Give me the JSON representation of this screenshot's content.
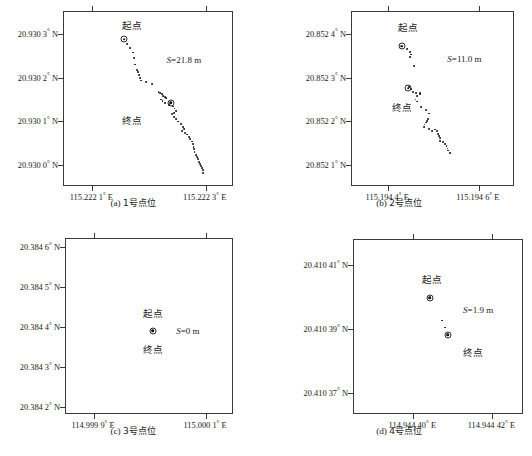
{
  "figure": {
    "panels": [
      {
        "id": "a",
        "caption_label": "(a)",
        "caption_text": "1号点位",
        "s_label": "S",
        "s_value": "=21.8 m",
        "s_full": "S=21.8 m",
        "start_label": "起点",
        "end_label": "终点",
        "y_ticks": [
          "20.930 3° N",
          "20.930 2° N",
          "20.930 1° N",
          "20.930 0° N"
        ],
        "x_ticks": [
          "115.222 1° E",
          "115.222 3° E"
        ]
      },
      {
        "id": "b",
        "caption_label": "(b)",
        "caption_text": "2号点位",
        "s_label": "S",
        "s_value": "=11.0 m",
        "s_full": "S=11.0 m",
        "start_label": "起点",
        "end_label": "终点",
        "y_ticks": [
          "20.852 4° N",
          "20.852 3° N",
          "20.852 2° N",
          "20.852 1° N"
        ],
        "x_ticks": [
          "115.194 4° E",
          "115.194 6° E"
        ]
      },
      {
        "id": "c",
        "caption_label": "(c)",
        "caption_text": "3号点位",
        "s_label": "S",
        "s_value": "=0 m",
        "s_full": "S=0 m",
        "start_label": "起点",
        "end_label": "终点",
        "y_ticks": [
          "20.384 6° N",
          "20.384 5° N",
          "20.384 4° N",
          "20.384 3° N",
          "20.384 2° N"
        ],
        "x_ticks": [
          "114.999 9° E",
          "115.000 1° E"
        ]
      },
      {
        "id": "d",
        "caption_label": "(d)",
        "caption_text": "4号点位",
        "s_label": "S",
        "s_value": "=1.9 m",
        "s_full": "S=1.9 m",
        "start_label": "起点",
        "end_label": "终点",
        "y_ticks": [
          "20.410 41° N",
          "20.410 39° N",
          "20.410 37° N"
        ],
        "x_ticks": [
          "114.944 40° E",
          "114.944 42° E"
        ]
      }
    ]
  },
  "chart_data": [
    {
      "type": "scatter",
      "panel": "a",
      "title": "(a) 1号点位",
      "xlabel": "",
      "ylabel": "",
      "xlim": [
        115.22205,
        115.22235
      ],
      "ylim": [
        20.92995,
        20.93035
      ],
      "xtick_values": [
        115.2221,
        115.2223
      ],
      "xtick_labels": [
        "115.222 1° E",
        "115.222 3° E"
      ],
      "ytick_values": [
        20.9303,
        20.9302,
        20.9301,
        20.93
      ],
      "ytick_labels": [
        "20.930 3° N",
        "20.930 2° N",
        "20.930 1° N",
        "20.930 0° N"
      ],
      "grid": false,
      "annotations": [
        {
          "text": "起点",
          "x_frac": 0.4,
          "y_frac": 0.075
        },
        {
          "text": "终点",
          "x_frac": 0.4,
          "y_frac": 0.615
        },
        {
          "text": "S=21.8 m",
          "x_frac": 0.705,
          "y_frac": 0.275
        }
      ],
      "markers": [
        {
          "name": "start",
          "x_frac": 0.355,
          "y_frac": 0.155
        },
        {
          "name": "end",
          "x_frac": 0.627,
          "y_frac": 0.518
        }
      ],
      "points_frac": [
        [
          0.372,
          0.183
        ],
        [
          0.388,
          0.205
        ],
        [
          0.404,
          0.232
        ],
        [
          0.411,
          0.265
        ],
        [
          0.416,
          0.3
        ],
        [
          0.428,
          0.33
        ],
        [
          0.437,
          0.345
        ],
        [
          0.44,
          0.36
        ],
        [
          0.447,
          0.378
        ],
        [
          0.453,
          0.392
        ],
        [
          0.485,
          0.4
        ],
        [
          0.52,
          0.41
        ],
        [
          0.556,
          0.455
        ],
        [
          0.566,
          0.462
        ],
        [
          0.575,
          0.47
        ],
        [
          0.584,
          0.478
        ],
        [
          0.593,
          0.487
        ],
        [
          0.601,
          0.494
        ],
        [
          0.57,
          0.5
        ],
        [
          0.58,
          0.51
        ],
        [
          0.592,
          0.52
        ],
        [
          0.618,
          0.53
        ],
        [
          0.64,
          0.54
        ],
        [
          0.65,
          0.552
        ],
        [
          0.657,
          0.565
        ],
        [
          0.648,
          0.575
        ],
        [
          0.635,
          0.585
        ],
        [
          0.647,
          0.598
        ],
        [
          0.66,
          0.612
        ],
        [
          0.673,
          0.626
        ],
        [
          0.686,
          0.64
        ],
        [
          0.7,
          0.655
        ],
        [
          0.705,
          0.668
        ],
        [
          0.697,
          0.678
        ],
        [
          0.712,
          0.69
        ],
        [
          0.726,
          0.7
        ],
        [
          0.735,
          0.713
        ],
        [
          0.744,
          0.726
        ],
        [
          0.752,
          0.74
        ],
        [
          0.758,
          0.755
        ],
        [
          0.762,
          0.77
        ],
        [
          0.764,
          0.785
        ],
        [
          0.768,
          0.8
        ],
        [
          0.775,
          0.815
        ],
        [
          0.782,
          0.828
        ],
        [
          0.79,
          0.84
        ],
        [
          0.795,
          0.855
        ],
        [
          0.8,
          0.868
        ],
        [
          0.806,
          0.88
        ],
        [
          0.812,
          0.892
        ],
        [
          0.818,
          0.905
        ],
        [
          0.82,
          0.918
        ]
      ]
    },
    {
      "type": "scatter",
      "panel": "b",
      "title": "(b) 2号点位",
      "xlabel": "",
      "ylabel": "",
      "xlim": [
        115.19432,
        115.19468
      ],
      "ylim": [
        20.85205,
        20.85245
      ],
      "xtick_values": [
        115.1944,
        115.1946
      ],
      "xtick_labels": [
        "115.194 4° E",
        "115.194 6° E"
      ],
      "ytick_values": [
        20.8524,
        20.8523,
        20.8522,
        20.8521
      ],
      "ytick_labels": [
        "20.852 4° N",
        "20.852 3° N",
        "20.852 2° N",
        "20.852 1° N"
      ],
      "grid": false,
      "annotations": [
        {
          "text": "起点",
          "x_frac": 0.345,
          "y_frac": 0.085
        },
        {
          "text": "终点",
          "x_frac": 0.305,
          "y_frac": 0.54
        },
        {
          "text": "S=11.0 m",
          "x_frac": 0.69,
          "y_frac": 0.27
        }
      ],
      "markers": [
        {
          "name": "start",
          "x_frac": 0.305,
          "y_frac": 0.195
        },
        {
          "name": "end",
          "x_frac": 0.345,
          "y_frac": 0.435
        }
      ],
      "points_frac": [
        [
          0.34,
          0.21
        ],
        [
          0.358,
          0.228
        ],
        [
          0.362,
          0.243
        ],
        [
          0.355,
          0.255
        ],
        [
          0.38,
          0.31
        ],
        [
          0.352,
          0.43
        ],
        [
          0.36,
          0.44
        ],
        [
          0.372,
          0.455
        ],
        [
          0.393,
          0.465
        ],
        [
          0.4,
          0.478
        ],
        [
          0.415,
          0.462
        ],
        [
          0.42,
          0.47
        ],
        [
          0.39,
          0.5
        ],
        [
          0.4,
          0.512
        ],
        [
          0.425,
          0.545
        ],
        [
          0.452,
          0.56
        ],
        [
          0.475,
          0.58
        ],
        [
          0.468,
          0.61
        ],
        [
          0.462,
          0.622
        ],
        [
          0.452,
          0.632
        ],
        [
          0.445,
          0.643
        ],
        [
          0.44,
          0.655
        ],
        [
          0.47,
          0.668
        ],
        [
          0.49,
          0.68
        ],
        [
          0.512,
          0.672
        ],
        [
          0.522,
          0.682
        ],
        [
          0.53,
          0.695
        ],
        [
          0.535,
          0.71
        ],
        [
          0.538,
          0.722
        ],
        [
          0.542,
          0.735
        ],
        [
          0.56,
          0.745
        ],
        [
          0.572,
          0.755
        ],
        [
          0.58,
          0.768
        ],
        [
          0.586,
          0.78
        ],
        [
          0.592,
          0.792
        ],
        [
          0.6,
          0.805
        ]
      ]
    },
    {
      "type": "scatter",
      "panel": "c",
      "title": "(c) 3号点位",
      "xlabel": "",
      "ylabel": "",
      "xlim": [
        114.99985,
        115.00015
      ],
      "ylim": [
        20.38418,
        20.38462
      ],
      "xtick_values": [
        114.9999,
        115.0001
      ],
      "xtick_labels": [
        "114.999 9° E",
        "115.000 1° E"
      ],
      "ytick_values": [
        20.3846,
        20.3845,
        20.3844,
        20.3843,
        20.3842
      ],
      "ytick_labels": [
        "20.384 6° N",
        "20.384 5° N",
        "20.384 4° N",
        "20.384 3° N",
        "20.384 2° N"
      ],
      "grid": false,
      "annotations": [
        {
          "text": "起点",
          "x_frac": 0.515,
          "y_frac": 0.42
        },
        {
          "text": "终点",
          "x_frac": 0.515,
          "y_frac": 0.625
        },
        {
          "text": "S=0 m",
          "x_frac": 0.725,
          "y_frac": 0.522
        }
      ],
      "markers": [
        {
          "name": "start-end",
          "x_frac": 0.517,
          "y_frac": 0.522
        }
      ],
      "points_frac": []
    },
    {
      "type": "scatter",
      "panel": "d",
      "title": "(d) 4号点位",
      "xlabel": "",
      "ylabel": "",
      "xlim": [
        114.944385,
        114.944428
      ],
      "ylim": [
        20.410363,
        20.410418
      ],
      "xtick_values": [
        114.9444,
        114.94442
      ],
      "xtick_labels": [
        "114.944 40° E",
        "114.944 42° E"
      ],
      "ytick_values": [
        20.41041,
        20.41039,
        20.41037
      ],
      "ytick_labels": [
        "20.410 41° N",
        "20.410 39° N",
        "20.410 37° N"
      ],
      "grid": false,
      "annotations": [
        {
          "text": "起点",
          "x_frac": 0.46,
          "y_frac": 0.222
        },
        {
          "text": "终点",
          "x_frac": 0.7,
          "y_frac": 0.64
        },
        {
          "text": "S=1.9 m",
          "x_frac": 0.73,
          "y_frac": 0.4
        }
      ],
      "markers": [
        {
          "name": "start",
          "x_frac": 0.445,
          "y_frac": 0.33
        },
        {
          "name": "end",
          "x_frac": 0.55,
          "y_frac": 0.54
        }
      ],
      "points_frac": [
        [
          0.52,
          0.46
        ],
        [
          0.537,
          0.5
        ]
      ]
    }
  ]
}
